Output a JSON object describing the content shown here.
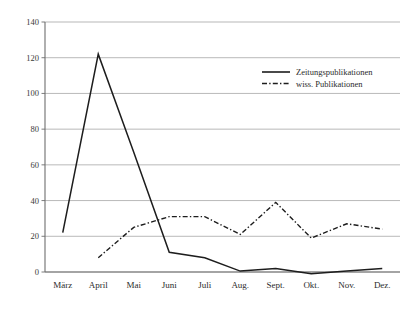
{
  "chart_data": {
    "type": "line",
    "title": "",
    "xlabel": "",
    "ylabel": "",
    "categories": [
      "März",
      "April",
      "Mai",
      "Juni",
      "Juli",
      "Aug.",
      "Sept.",
      "Okt.",
      "Nov.",
      "Dez."
    ],
    "ylim": [
      0,
      140
    ],
    "yticks": [
      0,
      20,
      40,
      60,
      80,
      100,
      120,
      140
    ],
    "ytick_labels": [
      "0",
      "20",
      "40",
      "60",
      "80",
      "100",
      "120",
      "140"
    ],
    "grid": true,
    "legend_position": "top-right",
    "series": [
      {
        "name": "Zeitungspublikationen",
        "style": "solid",
        "color": "#1d1d1d",
        "values": [
          22,
          122,
          67,
          11,
          8,
          0.5,
          2,
          -1,
          0.5,
          2
        ]
      },
      {
        "name": "wiss. Publikationen",
        "style": "dash-dot",
        "color": "#1d1d1d",
        "values": [
          null,
          8,
          25,
          31,
          31,
          21,
          39,
          19,
          27,
          24
        ]
      }
    ]
  },
  "legend": {
    "entries": [
      {
        "label": "Zeitungspublikationen",
        "style": "solid"
      },
      {
        "label": "wiss. Publikationen",
        "style": "dash-dot"
      }
    ]
  },
  "colors": {
    "ink": "#1d1d1d",
    "grid": "#9a9a9a",
    "axis": "#6e6e6e",
    "background": "#ffffff"
  }
}
